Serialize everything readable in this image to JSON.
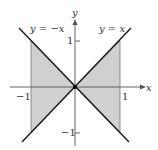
{
  "figure": {
    "region_fill": "#d0d0d0",
    "line_color": "#1a1a1a",
    "axis_color": "#555555",
    "axes": {
      "x_label": "x",
      "y_label": "y"
    },
    "ticks": {
      "x_pos": "1",
      "x_neg": "−1",
      "y_pos": "1",
      "y_neg": "−1"
    },
    "curves": [
      {
        "label": "y = −x"
      },
      {
        "label": "y = x"
      }
    ],
    "shaded_region": "between y = x and y = −x for −1 ≤ x ≤ 1"
  }
}
